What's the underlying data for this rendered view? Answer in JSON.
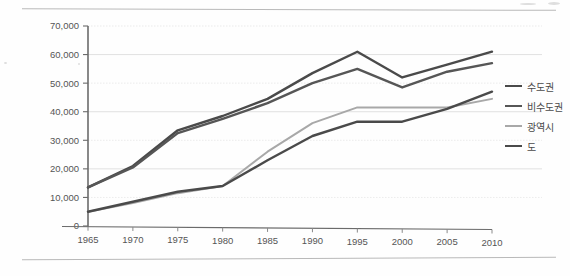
{
  "chart_data": {
    "type": "line",
    "title": "",
    "xlabel": "",
    "ylabel": "",
    "categories": [
      "1965",
      "1970",
      "1975",
      "1980",
      "1985",
      "1990",
      "1995",
      "2000",
      "2005",
      "2010"
    ],
    "x": [
      1965,
      1970,
      1975,
      1980,
      1985,
      1990,
      1995,
      2000,
      2005,
      2010
    ],
    "ylim": [
      0,
      70000
    ],
    "ytick_values": [
      0,
      10000,
      20000,
      30000,
      40000,
      50000,
      60000,
      70000
    ],
    "ytick_labels": [
      "0",
      "10,000",
      "20,000",
      "30,000",
      "40,000",
      "50,000",
      "60,000",
      "70,000"
    ],
    "grid": true,
    "grid_axis": "y",
    "legend_position": "right",
    "series": [
      {
        "name": "수도권",
        "color": "#4a4a4a",
        "values": [
          13500,
          21000,
          33500,
          38500,
          44500,
          53500,
          61000,
          52000,
          56500,
          61000
        ]
      },
      {
        "name": "비수도권",
        "color": "#565656",
        "values": [
          13500,
          20500,
          32500,
          37500,
          43000,
          50000,
          55000,
          48500,
          54000,
          57000
        ]
      },
      {
        "name": "광역시",
        "color": "#a8a8a8",
        "values": [
          5000,
          8000,
          11500,
          14000,
          26000,
          36000,
          41500,
          41500,
          41500,
          44500
        ]
      },
      {
        "name": "도",
        "color": "#4a4a4a",
        "values": [
          5000,
          8500,
          12000,
          14000,
          23000,
          31500,
          36500,
          36500,
          41000,
          47000
        ]
      }
    ]
  },
  "legend": {
    "items": [
      {
        "label": "수도권",
        "color": "#4a4a4a",
        "width": 2.6
      },
      {
        "label": "비수도권",
        "color": "#565656",
        "width": 2.6
      },
      {
        "label": "광역시",
        "color": "#a8a8a8",
        "width": 2.0
      },
      {
        "label": "도",
        "color": "#4a4a4a",
        "width": 2.6
      }
    ]
  },
  "axis": {
    "y_min_label": "0",
    "y_max_label": "70,000"
  }
}
